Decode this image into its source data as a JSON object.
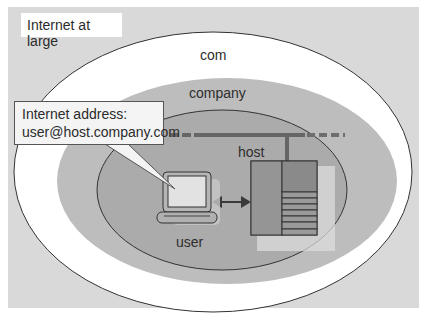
{
  "diagram": {
    "title": "Internet at large",
    "domains": {
      "outer": "com",
      "middle": "company",
      "inner": "host"
    },
    "callout": {
      "line1": "Internet address:",
      "line2": "user@host.company.com"
    },
    "user_label": "user",
    "icons": [
      "laptop-icon",
      "server-rack-icon",
      "double-arrow-icon",
      "network-bus-line"
    ],
    "colors": {
      "background": "#d9d9d9",
      "outer_ellipse": "#ffffff",
      "middle_ellipse": "#bdbdbd",
      "inner_ellipse": "#a9a9a9",
      "server": "#8c8c8c",
      "network_line": "#6b6b6b",
      "arrow": "#444444"
    }
  }
}
